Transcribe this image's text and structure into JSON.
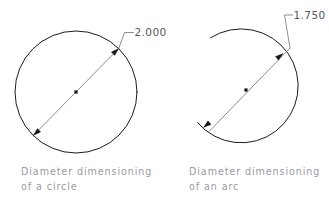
{
  "page": {
    "background_color": "#ffffff",
    "width": 329,
    "height": 205,
    "title": "Diameter dimensioning"
  },
  "colors": {
    "geometry_stroke": "#1a1a1a",
    "dimension_stroke": "#6e6e78",
    "dimension_text": "#55555e",
    "caption_text": "#9a9aa2",
    "arrow_fill": "#15151a"
  },
  "figures": [
    {
      "id": "circle-figure",
      "shape": "circle",
      "dimension_value": "2.000",
      "caption_line_1": "Diameter dimensioning",
      "caption_line_2": "of a circle"
    },
    {
      "id": "arc-figure",
      "shape": "arc",
      "dimension_value": "1.750",
      "caption_line_1": "Diameter dimensioning",
      "caption_line_2": "of an arc"
    }
  ]
}
